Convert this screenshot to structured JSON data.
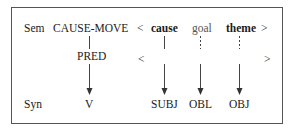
{
  "diagram": {
    "rows": {
      "sem": {
        "label": "Sem",
        "predicate": "CAUSE-MOVE",
        "open": "<",
        "close": ">",
        "args": [
          {
            "text": "cause",
            "bold": true,
            "link": "solid"
          },
          {
            "text": "goal",
            "bold": false,
            "link": "dashed"
          },
          {
            "text": "theme",
            "bold": true,
            "link": "dashed"
          }
        ]
      },
      "pred": {
        "label": "PRED",
        "open": "<",
        "close": ">"
      },
      "syn": {
        "label": "Syn",
        "verb": "V",
        "functions": [
          "SUBJ",
          "OBL",
          "OBJ"
        ]
      }
    },
    "colors": {
      "frame": "#555555",
      "text": "#1a1a1a",
      "line": "#444444"
    }
  }
}
